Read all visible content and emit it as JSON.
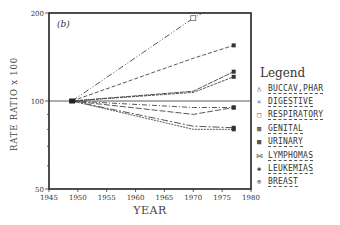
{
  "chart_data": {
    "type": "line",
    "panel_label": "(b)",
    "title": "",
    "xlabel": "YEAR",
    "ylabel": "RATE RATIO x 100",
    "y_scale": "log",
    "xlim": [
      1945,
      1980
    ],
    "ylim": [
      50,
      200
    ],
    "x_ticks": [
      1945,
      1950,
      1955,
      1960,
      1965,
      1970,
      1975,
      1980
    ],
    "y_ticks": [
      50,
      100,
      200
    ],
    "reference_line": 100,
    "x": [
      1949,
      1970,
      1977
    ],
    "series": [
      {
        "name": "BUCCAV,PHAR",
        "marker": "triangle",
        "values": [
          100,
          95,
          95
        ]
      },
      {
        "name": "DIGESTIVE",
        "marker": "x",
        "values": [
          100,
          140,
          155
        ]
      },
      {
        "name": "RESPIRATORY",
        "marker": "square-open",
        "values": [
          100,
          192,
          230
        ]
      },
      {
        "name": "GENITAL",
        "marker": "square-filled",
        "values": [
          100,
          108,
          126
        ]
      },
      {
        "name": "URINARY",
        "marker": "square-filled",
        "values": [
          100,
          107,
          121
        ]
      },
      {
        "name": "LYMPHOMAS",
        "marker": "x",
        "values": [
          100,
          90,
          95
        ]
      },
      {
        "name": "LEUKEMIAS",
        "marker": "dot",
        "values": [
          100,
          80,
          80
        ]
      },
      {
        "name": "BREAST",
        "marker": "circle-plus",
        "values": [
          100,
          82,
          81
        ]
      }
    ],
    "legend_position": "right"
  },
  "legend": {
    "title": "Legend",
    "items": [
      {
        "marker": "△",
        "label": "BUCCAV,PHAR"
      },
      {
        "marker": "×",
        "label": "DIGESTIVE"
      },
      {
        "marker": "□",
        "label": "RESPIRATORY"
      },
      {
        "marker": "▩",
        "label": "GENITAL"
      },
      {
        "marker": "■",
        "label": "URINARY"
      },
      {
        "marker": "⋈",
        "label": "LYMPHOMAS"
      },
      {
        "marker": "◆",
        "label": "LEUKEMIAS"
      },
      {
        "marker": "⊕",
        "label": "BREAST"
      }
    ]
  }
}
